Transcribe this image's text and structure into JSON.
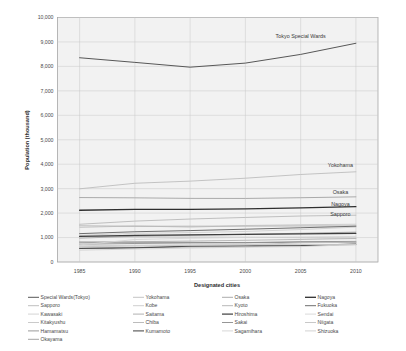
{
  "chart_data": {
    "type": "line",
    "title": "",
    "xlabel": "Designated cities",
    "ylabel": "Population (thousand)",
    "x": [
      1985,
      1990,
      1995,
      2000,
      2005,
      2010
    ],
    "xlim": [
      1983,
      2012
    ],
    "ylim": [
      0,
      10000
    ],
    "ytick_labels": [
      "0",
      "1,000",
      "2,000",
      "3,000",
      "4,000",
      "5,000",
      "6,000",
      "7,000",
      "8,000",
      "9,000",
      "10,000"
    ],
    "yticks": [
      0,
      1000,
      2000,
      3000,
      4000,
      5000,
      6000,
      7000,
      8000,
      9000,
      10000
    ],
    "xtick_labels": [
      "1985",
      "1990",
      "1995",
      "2000",
      "2005",
      "2010"
    ],
    "grid": true,
    "legend_position": "bottom",
    "annotations": [
      {
        "text": "Tokyo Special Wards",
        "x": 2005.0,
        "y": 9150
      },
      {
        "text": "Yokohama",
        "x": 2008.6,
        "y": 3880
      },
      {
        "text": "Osaka",
        "x": 2008.6,
        "y": 2790
      },
      {
        "text": "Nagoya",
        "x": 2008.6,
        "y": 2270
      },
      {
        "text": "Sapporo",
        "x": 2008.6,
        "y": 1880
      }
    ],
    "series": [
      {
        "name": "Special Wards(Tokyo)",
        "color": "#575757",
        "width": 1.0,
        "values": [
          8354,
          8164,
          7968,
          8135,
          8490,
          8946
        ]
      },
      {
        "name": "Sapporo",
        "color": "#b9b9b9",
        "width": 0.9,
        "values": [
          1543,
          1672,
          1757,
          1822,
          1881,
          1914
        ]
      },
      {
        "name": "Kawasaki",
        "color": "#cfcfcf",
        "width": 0.9,
        "values": [
          1089,
          1174,
          1203,
          1250,
          1327,
          1426
        ]
      },
      {
        "name": "Kitakyushu",
        "color": "#c4c4c4",
        "width": 0.9,
        "values": [
          1056,
          1026,
          1020,
          1011,
          994,
          977
        ]
      },
      {
        "name": "Hamamatsu",
        "color": "#8f8f8f",
        "width": 0.9,
        "values": [
          728,
          757,
          779,
          786,
          804,
          801
        ]
      },
      {
        "name": "Okayama",
        "color": "#9a9a9a",
        "width": 0.9,
        "values": [
          572,
          594,
          616,
          626,
          674,
          710
        ]
      },
      {
        "name": "Yokohama",
        "color": "#bdbdbd",
        "width": 0.9,
        "values": [
          2993,
          3220,
          3307,
          3427,
          3579,
          3689
        ]
      },
      {
        "name": "Kobe",
        "color": "#c9c9c9",
        "width": 0.9,
        "values": [
          1410,
          1477,
          1423,
          1493,
          1525,
          1544
        ]
      },
      {
        "name": "Saitama",
        "color": "#a8a8a8",
        "width": 0.9,
        "values": [
          975,
          1052,
          1098,
          1134,
          1176,
          1222
        ]
      },
      {
        "name": "Chiba",
        "color": "#b4b4b4",
        "width": 0.9,
        "values": [
          789,
          829,
          856,
          887,
          924,
          962
        ]
      },
      {
        "name": "Kumamoto",
        "color": "#4f4f4f",
        "width": 1.1,
        "values": [
          555,
          579,
          650,
          662,
          670,
          734
        ]
      },
      {
        "name": "Osaka",
        "color": "#a2a2a2",
        "width": 0.9,
        "values": [
          2636,
          2624,
          2602,
          2599,
          2629,
          2665
        ]
      },
      {
        "name": "Kyoto",
        "color": "#b0b0b0",
        "width": 0.9,
        "values": [
          1479,
          1461,
          1464,
          1468,
          1475,
          1474
        ]
      },
      {
        "name": "Hiroshima",
        "color": "#3d3d3d",
        "width": 1.2,
        "values": [
          1044,
          1086,
          1109,
          1126,
          1154,
          1174
        ]
      },
      {
        "name": "Sakai",
        "color": "#8a8a8a",
        "width": 0.9,
        "values": [
          818,
          808,
          802,
          792,
          831,
          842
        ]
      },
      {
        "name": "Sagamihara",
        "color": "#d2d2d2",
        "width": 0.9,
        "values": [
          483,
          531,
          571,
          606,
          628,
          718
        ]
      },
      {
        "name": "Nagoya",
        "color": "#2f2f2f",
        "width": 1.3,
        "values": [
          2116,
          2155,
          2152,
          2172,
          2215,
          2264
        ]
      },
      {
        "name": "Fukuoka",
        "color": "#6e6e6e",
        "width": 1.0,
        "values": [
          1160,
          1237,
          1285,
          1341,
          1401,
          1464
        ]
      },
      {
        "name": "Sendai",
        "color": "#d6d6d6",
        "width": 0.9,
        "values": [
          700,
          918,
          971,
          1008,
          1025,
          1046
        ]
      },
      {
        "name": "Niigata",
        "color": "#c2c2c2",
        "width": 0.9,
        "values": [
          627,
          655,
          679,
          701,
          785,
          812
        ]
      },
      {
        "name": "Shizuoka",
        "color": "#cdcdcd",
        "width": 0.9,
        "values": [
          662,
          684,
          703,
          714,
          717,
          716
        ]
      }
    ]
  },
  "legend": {
    "columns": [
      [
        "Special Wards(Tokyo)",
        "Sapporo",
        "Kawasaki",
        "Kitakyushu",
        "Hamamatsu",
        "Okayama"
      ],
      [
        "Yokohama",
        "Kobe",
        "Saitama",
        "Chiba",
        "Kumamoto"
      ],
      [
        "Osaka",
        "Kyoto",
        "Hiroshima",
        "Sakai",
        "Sagamihara"
      ],
      [
        "Nagoya",
        "Fukuoka",
        "Sendai",
        "Niigata",
        "Shizuoka"
      ]
    ]
  }
}
